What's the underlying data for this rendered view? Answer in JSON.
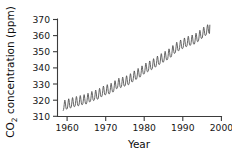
{
  "figure": {
    "background_color": "#ffffff",
    "axis_color": "#3b3b3b",
    "line_color": "#4a4a4a",
    "text_color": "#161616"
  },
  "axes": {
    "y_title_prefix": "CO",
    "y_title_subscript": "2",
    "y_title_suffix": " concentration (ppm)",
    "y_title_full": "CO2 concentration (ppm)",
    "x_title": "Year",
    "y_ticks": [
      "310",
      "320",
      "330",
      "340",
      "350",
      "360",
      "370"
    ],
    "x_ticks": [
      "1960",
      "1970",
      "1980",
      "1990",
      "2000"
    ]
  },
  "chart_data": {
    "type": "line",
    "title": "",
    "subtitle": "",
    "xlabel": "Year",
    "ylabel": "CO2 concentration (ppm)",
    "xlim": [
      1957.5,
      2000
    ],
    "ylim": [
      310,
      372
    ],
    "xticks": [
      1960,
      1970,
      1980,
      1990,
      2000
    ],
    "yticks": [
      310,
      320,
      330,
      340,
      350,
      360,
      370
    ],
    "grid": false,
    "legend": null,
    "annotations": [],
    "series": [
      {
        "name": "Atmospheric CO2 (Mauna Loa monthly mean)",
        "color": "#4a4a4a",
        "seasonal_amplitude_ppm": 6.0,
        "seasonal_peak_month": 5,
        "x": [
          1959.0,
          1960.0,
          1961.0,
          1962.0,
          1963.0,
          1964.0,
          1965.0,
          1966.0,
          1967.0,
          1968.0,
          1969.0,
          1970.0,
          1971.0,
          1972.0,
          1973.0,
          1974.0,
          1975.0,
          1976.0,
          1977.0,
          1978.0,
          1979.0,
          1980.0,
          1981.0,
          1982.0,
          1983.0,
          1984.0,
          1985.0,
          1986.0,
          1987.0,
          1988.0,
          1989.0,
          1990.0,
          1991.0,
          1992.0,
          1993.0,
          1994.0,
          1995.0,
          1996.0,
          1997.0
        ],
        "values": [
          315.9,
          316.9,
          317.6,
          318.4,
          318.9,
          319.6,
          320.0,
          321.4,
          322.2,
          323.0,
          324.6,
          325.7,
          326.3,
          327.5,
          329.7,
          330.2,
          331.1,
          332.0,
          333.8,
          335.4,
          336.8,
          338.7,
          340.1,
          341.4,
          343.0,
          344.6,
          346.0,
          347.4,
          349.2,
          351.6,
          353.1,
          354.4,
          355.6,
          356.4,
          357.1,
          358.8,
          360.8,
          362.6,
          363.8
        ]
      }
    ]
  }
}
